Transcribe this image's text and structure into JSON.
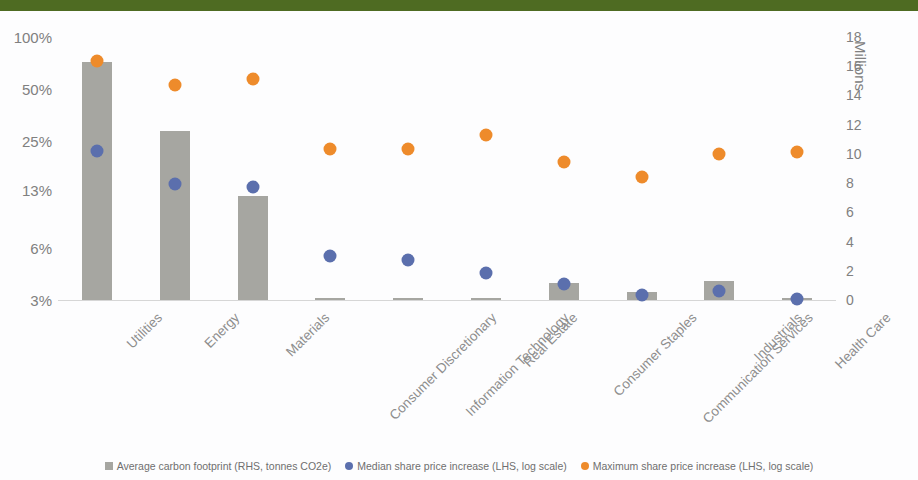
{
  "header_band_color": "#4e6b22",
  "chart_data": {
    "type": "bar",
    "title": "",
    "subtitle": "",
    "xlabel": "",
    "ylabel": "",
    "grid": false,
    "legend_position": "bottom",
    "categories": [
      "Utilities",
      "Energy",
      "Materials",
      "Consumer Discretionary",
      "Information Technology",
      "Real Estate",
      "Consumer Staples",
      "Communication Services",
      "Industrials",
      "Health Care"
    ],
    "left_axis": {
      "label": "",
      "scale": "log",
      "tick_labels": [
        "100%",
        "50%",
        "25%",
        "13%",
        "6%",
        "3%"
      ],
      "tick_values": [
        100,
        50,
        25,
        13,
        6,
        3
      ],
      "ylim": [
        3,
        100
      ]
    },
    "right_axis": {
      "label": "Millions",
      "scale": "linear",
      "tick_labels": [
        "18",
        "16",
        "14",
        "12",
        "10",
        "8",
        "6",
        "4",
        "2",
        "0"
      ],
      "tick_values": [
        18,
        16,
        14,
        12,
        10,
        8,
        6,
        4,
        2,
        0
      ],
      "ylim": [
        0,
        18
      ]
    },
    "series": [
      {
        "name": "Average carbon footprint (RHS, tonnes CO2e)",
        "type": "bar",
        "axis": "right",
        "color": "#a6a6a1",
        "values": [
          16.3,
          11.6,
          7.1,
          0.12,
          0.1,
          0.05,
          1.15,
          0.55,
          1.3,
          0.04
        ]
      },
      {
        "name": "Median share price increase (LHS, log scale)",
        "type": "scatter",
        "axis": "left",
        "color": "#5b6fad",
        "values": [
          22,
          14,
          13.5,
          5.4,
          5.1,
          4.3,
          3.7,
          3.2,
          3.4,
          3.05
        ]
      },
      {
        "name": "Maximum share price increase (LHS, log scale)",
        "type": "scatter",
        "axis": "left",
        "color": "#ee8b2b",
        "values": [
          73,
          53,
          57,
          22.5,
          22.5,
          27,
          19,
          15.5,
          21,
          21.5
        ]
      }
    ]
  },
  "legend": {
    "items": [
      {
        "marker": "square-marker",
        "label": "Average carbon footprint (RHS, tonnes CO2e)"
      },
      {
        "marker": "circle-marker",
        "label": "Median share price increase (LHS, log scale)"
      },
      {
        "marker": "circle-marker",
        "label": "Maximum share price increase (LHS, log scale)"
      }
    ]
  }
}
